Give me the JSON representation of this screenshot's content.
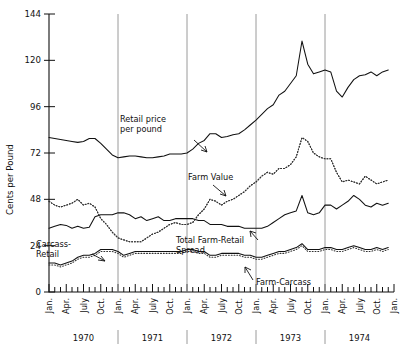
{
  "chart_data": {
    "type": "line",
    "title": "",
    "xlabel": "",
    "ylabel": "Cents per Pound",
    "ylim": [
      0,
      144
    ],
    "yticks": [
      0,
      24,
      48,
      72,
      96,
      120,
      144
    ],
    "grid": false,
    "legend_position": "inline-annotations",
    "x_tick_labels": [
      "Jan.",
      "Apr.",
      "July",
      "Oct."
    ],
    "years": [
      "1970",
      "1971",
      "1972",
      "1973",
      "1974"
    ],
    "x_note": "Monthly observations, Jan. 1970 through Jan. 1975; ticks every month, labels every 3 months",
    "annotations": [
      {
        "name": "retail-price-label",
        "text": "Retail price\nper pound",
        "line1": "Retail price",
        "line2": "per pound"
      },
      {
        "name": "farm-value-label",
        "text": "Farm Value",
        "line1": "Farm Value",
        "line2": ""
      },
      {
        "name": "total-spread-label",
        "text": "Total Farm-Retail\nSpread",
        "line1": "Total Farm-Retail",
        "line2": "Spread"
      },
      {
        "name": "carcass-retail-label",
        "text": "Carcass-\nRetail",
        "line1": "Carcass-",
        "line2": "Retail"
      },
      {
        "name": "farm-carcass-label",
        "text": "Farm-Carcass",
        "line1": "Farm-Carcass",
        "line2": ""
      }
    ],
    "series": [
      {
        "name": "Retail price per pound",
        "style": "solid",
        "values": [
          80,
          79.5,
          79,
          78.5,
          78,
          77.5,
          78,
          79.5,
          79.5,
          77,
          74,
          71,
          69.5,
          70,
          70.5,
          70.5,
          70,
          69.5,
          69.5,
          70,
          70.5,
          71.5,
          71.5,
          71.5,
          72,
          74,
          77,
          78.5,
          82,
          82,
          80,
          80.5,
          81.5,
          82,
          84,
          86.5,
          89,
          92,
          95,
          97,
          102,
          104,
          108,
          112,
          130,
          118,
          113,
          114,
          115,
          114,
          104,
          101,
          106,
          110,
          112,
          112.5,
          114,
          112,
          114,
          115
        ]
      },
      {
        "name": "Farm Value",
        "style": "dotted",
        "values": [
          47,
          45,
          44,
          45,
          46,
          48,
          45,
          46,
          44,
          38,
          35,
          31,
          28,
          27,
          26,
          26,
          26,
          28,
          30,
          31,
          33,
          35,
          36,
          35,
          35,
          36,
          40,
          43,
          48,
          47,
          45,
          47,
          48,
          50,
          52,
          55,
          57,
          60,
          62,
          61,
          64,
          64,
          66,
          70,
          80,
          78,
          72,
          70,
          69,
          69,
          62,
          57,
          58,
          57,
          56,
          60,
          58,
          56,
          57,
          58
        ]
      },
      {
        "name": "Total Farm-Retail Spread",
        "style": "solid",
        "values": [
          33,
          34,
          35,
          34.5,
          33,
          34,
          33,
          33.5,
          39,
          40,
          40,
          40,
          41,
          41,
          40,
          38,
          39,
          37,
          38,
          39,
          37,
          37,
          38,
          38,
          38,
          38,
          37,
          37,
          35,
          35,
          35,
          34,
          34,
          34,
          33,
          33,
          33,
          33,
          34,
          36,
          38,
          40,
          41,
          42,
          50,
          41,
          40,
          41,
          45,
          45,
          43,
          45,
          47,
          50,
          48,
          45,
          44,
          46,
          45,
          46
        ]
      },
      {
        "name": "Farm-Carcass",
        "style": "solid",
        "values": [
          15,
          15,
          14,
          15,
          16,
          18,
          19,
          19,
          20,
          22,
          22,
          22,
          21,
          19,
          20,
          21,
          21,
          21,
          21,
          21,
          21,
          21,
          21,
          21,
          22,
          22,
          21,
          21,
          19,
          19,
          20,
          20,
          20,
          20,
          19,
          19,
          18,
          18,
          19,
          20,
          21,
          21,
          22,
          23,
          25,
          22,
          22,
          22,
          23,
          23,
          22,
          22,
          23,
          24,
          23,
          22,
          22,
          23,
          22,
          23
        ]
      },
      {
        "name": "Carcass-Retail (dotted companion)",
        "style": "dotted",
        "values": [
          14,
          14,
          13,
          14,
          15,
          17,
          18,
          18,
          19,
          21,
          21,
          21,
          20,
          18,
          19,
          20,
          20,
          20,
          20,
          20,
          20,
          20,
          20,
          20,
          21,
          21,
          20,
          20,
          18,
          18,
          19,
          19,
          19,
          19,
          18,
          18,
          17,
          17,
          18,
          19,
          20,
          20,
          21,
          22,
          24,
          21,
          21,
          21,
          22,
          22,
          21,
          21,
          22,
          23,
          22,
          21,
          21,
          22,
          21,
          22
        ]
      },
      {
        "name": "Carcass-Retail spread lower dotted",
        "style": "dotted",
        "values": [
          47,
          45,
          44,
          45,
          46,
          48,
          45,
          46,
          44,
          38,
          35,
          31,
          28,
          27,
          26,
          26,
          26,
          28,
          30,
          31,
          33,
          35,
          36,
          35,
          35,
          36,
          40,
          43,
          48,
          47,
          45,
          47,
          48,
          50,
          52,
          55,
          57,
          60,
          62,
          61,
          64,
          64,
          66,
          70,
          80,
          78,
          72,
          70,
          69,
          69,
          62,
          57,
          58,
          57,
          56,
          60,
          58,
          56,
          57,
          58
        ]
      }
    ]
  }
}
